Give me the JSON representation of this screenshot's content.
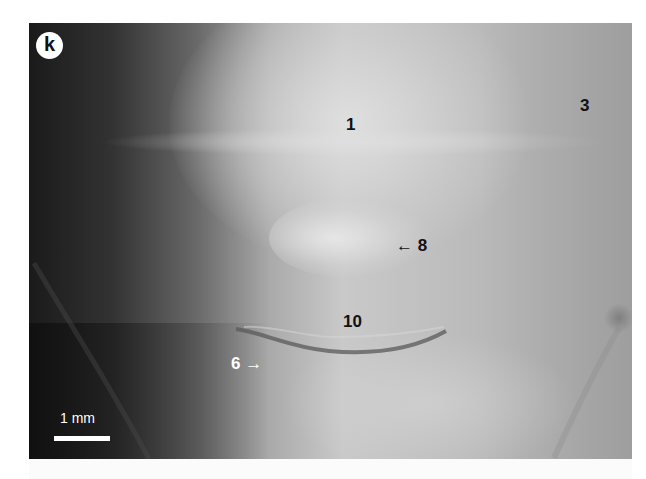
{
  "figure": {
    "panel_label": "k",
    "labels": [
      {
        "id": "label-1",
        "text": "1",
        "x": 346,
        "y": 115,
        "color": "black"
      },
      {
        "id": "label-3",
        "text": "3",
        "x": 580,
        "y": 96,
        "color": "black"
      },
      {
        "id": "label-8",
        "text": "← 8",
        "x": 397,
        "y": 236,
        "color": "black"
      },
      {
        "id": "label-10",
        "text": "10",
        "x": 343,
        "y": 312,
        "color": "black"
      },
      {
        "id": "label-6",
        "text": "6 →",
        "x": 231,
        "y": 354,
        "color": "white"
      }
    ],
    "scale_bar": {
      "label": "1 mm"
    }
  }
}
